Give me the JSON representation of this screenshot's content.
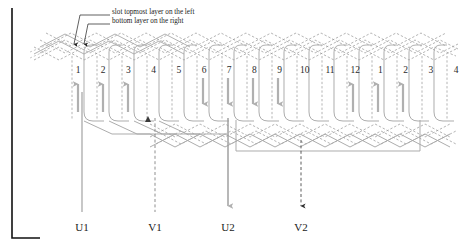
{
  "diagram": {
    "callouts": [
      {
        "text": "slot topmost layer on the left",
        "x": 112,
        "y": 12
      },
      {
        "text": "bottom layer on the right",
        "x": 112,
        "y": 21
      }
    ],
    "slot_numbers": [
      "1",
      "2",
      "3",
      "4",
      "5",
      "6",
      "7",
      "8",
      "9",
      "10",
      "11",
      "12",
      "1",
      "2",
      "3",
      "4"
    ],
    "slot_first_x": 78,
    "slot_pitch": 25.2,
    "slot_number_y": 66,
    "slot_arrows": [
      {
        "slot": 1,
        "dir": "up"
      },
      {
        "slot": 2,
        "dir": "up"
      },
      {
        "slot": 3,
        "dir": "up"
      },
      {
        "slot": 4,
        "dir": "none"
      },
      {
        "slot": 5,
        "dir": "none"
      },
      {
        "slot": 6,
        "dir": "down"
      },
      {
        "slot": 7,
        "dir": "down"
      },
      {
        "slot": 8,
        "dir": "down"
      },
      {
        "slot": 9,
        "dir": "down"
      },
      {
        "slot": 10,
        "dir": "none"
      },
      {
        "slot": 11,
        "dir": "none"
      },
      {
        "slot": 12,
        "dir": "up"
      },
      {
        "slot": 13,
        "dir": "up"
      },
      {
        "slot": 14,
        "dir": "up"
      },
      {
        "slot": 15,
        "dir": "none"
      },
      {
        "slot": 16,
        "dir": "none"
      }
    ],
    "terminals": [
      {
        "label": "U1",
        "x": 82,
        "y": 222,
        "style": "solid",
        "arrowhead": false,
        "color": "#9a9a9a"
      },
      {
        "label": "V1",
        "x": 155,
        "y": 222,
        "style": "dashed",
        "arrowhead": false,
        "color": "#8f8f8f"
      },
      {
        "label": "U2",
        "x": 228,
        "y": 222,
        "style": "solid",
        "arrowhead": true,
        "color": "#9a9a9a"
      },
      {
        "label": "V2",
        "x": 301,
        "y": 222,
        "style": "dashed",
        "arrowhead": true,
        "color": "#4a4a4a"
      }
    ],
    "colors": {
      "winding_solid": "#a8a8a8",
      "winding_dashed": "#9b9b9b",
      "arrow": "#b0b0b0",
      "frame": "#111111",
      "leader": "#2b2b2b"
    }
  }
}
